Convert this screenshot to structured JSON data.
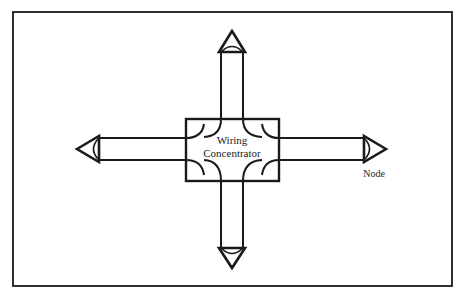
{
  "diagram": {
    "type": "star-topology",
    "center": {
      "label_line1": "Wiring",
      "label_line2": "Concentrator"
    },
    "nodes": [
      {
        "id": "top",
        "label": ""
      },
      {
        "id": "left",
        "label": ""
      },
      {
        "id": "right",
        "label": "Node"
      },
      {
        "id": "bottom",
        "label": ""
      }
    ],
    "colors": {
      "stroke": "#1a1a1a",
      "background": "#ffffff"
    }
  }
}
